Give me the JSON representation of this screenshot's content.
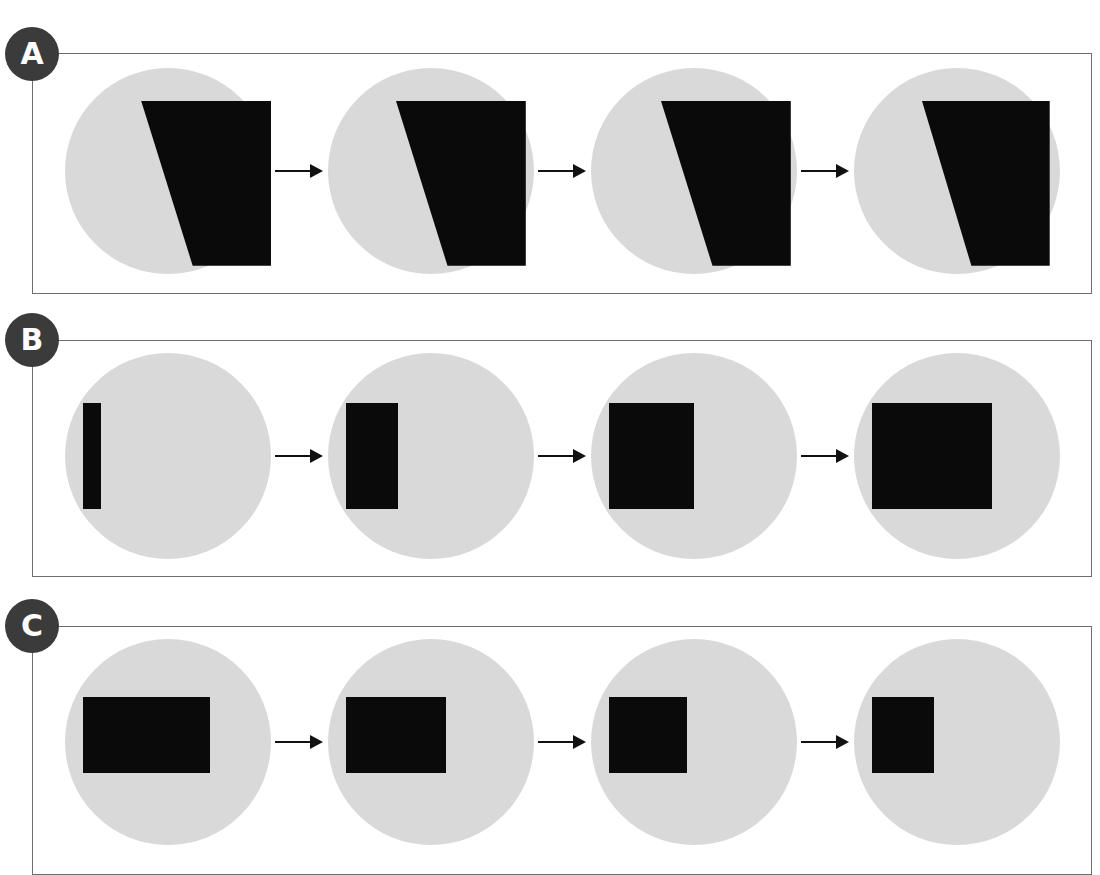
{
  "figure": {
    "width": 1100,
    "height": 875,
    "background": "#ffffff",
    "disc_color": "#d9d9d9",
    "shape_color": "#0a0a0a",
    "frame_color": "#6e6e6e",
    "badge_color": "#3b3b3b",
    "badge_text_color": "#ffffff",
    "arrow_color": "#111111"
  },
  "panels": [
    {
      "id": "A",
      "label": "A",
      "frame": {
        "left": 32,
        "top": 53,
        "width": 1060,
        "height": 241
      },
      "badge": {
        "left": 5,
        "top": 27
      },
      "row": {
        "left": 60,
        "top": 63
      },
      "arrows": 3,
      "arrow_label": "arrow-right",
      "steps": [
        {
          "index": 1,
          "shape_type": "polygon",
          "shape_name": "notched-quadrilateral",
          "points": "37,16 100,16 100,96 62,96",
          "width_pct": 63,
          "height_pct": 80,
          "description": "quadrilateral with diagonal lower-left edge"
        },
        {
          "index": 2,
          "shape_type": "polygon",
          "shape_name": "notched-quadrilateral",
          "points": "33,16 96,16 96,96 58,96",
          "width_pct": 63,
          "height_pct": 80,
          "description": "quadrilateral with diagonal lower-left edge"
        },
        {
          "index": 3,
          "shape_type": "polygon",
          "shape_name": "notched-quadrilateral",
          "points": "34,16 97,16 97,96 59,96",
          "width_pct": 63,
          "height_pct": 80,
          "description": "quadrilateral with diagonal lower-left edge"
        },
        {
          "index": 4,
          "shape_type": "polygon",
          "shape_name": "notched-quadrilateral",
          "points": "33,16 95,16 95,96 57,96",
          "width_pct": 62,
          "height_pct": 80,
          "description": "quadrilateral with diagonal lower-left edge"
        }
      ]
    },
    {
      "id": "B",
      "label": "B",
      "frame": {
        "left": 32,
        "top": 340,
        "width": 1060,
        "height": 237
      },
      "badge": {
        "left": 5,
        "top": 313
      },
      "row": {
        "left": 60,
        "top": 348
      },
      "arrows": 3,
      "arrow_label": "arrow-right",
      "steps": [
        {
          "index": 1,
          "shape_type": "rect",
          "shape_name": "black-rectangle",
          "left": 18,
          "top": 50,
          "width": 18,
          "height": 106,
          "description": "narrow tall bar"
        },
        {
          "index": 2,
          "shape_type": "rect",
          "shape_name": "black-rectangle",
          "left": 18,
          "top": 50,
          "width": 52,
          "height": 106,
          "description": "narrow rectangle"
        },
        {
          "index": 3,
          "shape_type": "rect",
          "shape_name": "black-rectangle",
          "left": 18,
          "top": 50,
          "width": 85,
          "height": 106,
          "description": "square"
        },
        {
          "index": 4,
          "shape_type": "rect",
          "shape_name": "black-rectangle",
          "left": 18,
          "top": 50,
          "width": 120,
          "height": 106,
          "description": "wide rectangle"
        }
      ]
    },
    {
      "id": "C",
      "label": "C",
      "frame": {
        "left": 32,
        "top": 626,
        "width": 1060,
        "height": 249
      },
      "badge": {
        "left": 5,
        "top": 599
      },
      "row": {
        "left": 60,
        "top": 634
      },
      "arrows": 3,
      "arrow_label": "arrow-right",
      "steps": [
        {
          "index": 1,
          "shape_type": "rect",
          "shape_name": "black-rectangle",
          "left": 18,
          "top": 58,
          "width": 127,
          "height": 76,
          "description": "wide rectangle"
        },
        {
          "index": 2,
          "shape_type": "rect",
          "shape_name": "black-rectangle",
          "left": 18,
          "top": 58,
          "width": 100,
          "height": 76,
          "description": "rectangle"
        },
        {
          "index": 3,
          "shape_type": "rect",
          "shape_name": "black-rectangle",
          "left": 18,
          "top": 58,
          "width": 78,
          "height": 76,
          "description": "near-square rectangle"
        },
        {
          "index": 4,
          "shape_type": "rect",
          "shape_name": "black-rectangle",
          "left": 18,
          "top": 58,
          "width": 62,
          "height": 76,
          "description": "square"
        }
      ]
    }
  ]
}
